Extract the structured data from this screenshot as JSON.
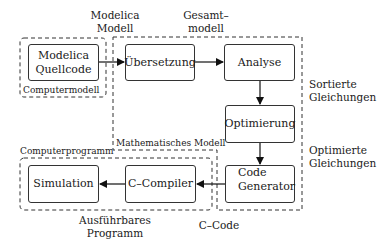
{
  "diagram": {
    "title_labels": {
      "modelica_modell": [
        "Modelica",
        "Modell"
      ],
      "gesamtmodell": [
        "Gesamt–",
        "modell"
      ],
      "sortierte_gleichungen": [
        "Sortierte",
        "Gleichungen"
      ],
      "optimierte_gleichungen": [
        "Optimierte",
        "Gleichungen"
      ],
      "c_code": "C–Code",
      "ausfuehrbares_programm": [
        "Ausführbares",
        "Programm"
      ]
    },
    "regions": {
      "computermodell": "Computermodell",
      "mathematisches_modell": "Mathematisches Modell",
      "computerprogramm": "Computerprogramm"
    },
    "nodes": {
      "quellcode": [
        "Modelica",
        "Quellcode"
      ],
      "uebersetzung": "Übersetzung",
      "analyse": "Analyse",
      "optimierung": "Optimierung",
      "code_generator": [
        "Code",
        "Generator"
      ],
      "c_compiler": "C–Compiler",
      "simulation": "Simulation"
    },
    "edges": [
      {
        "from": "Modelica Quellcode",
        "to": "Übersetzung"
      },
      {
        "from": "Übersetzung",
        "to": "Analyse"
      },
      {
        "from": "Analyse",
        "to": "Optimierung"
      },
      {
        "from": "Optimierung",
        "to": "Code Generator"
      },
      {
        "from": "Code Generator",
        "to": "C–Compiler"
      },
      {
        "from": "C–Compiler",
        "to": "Simulation"
      }
    ]
  }
}
